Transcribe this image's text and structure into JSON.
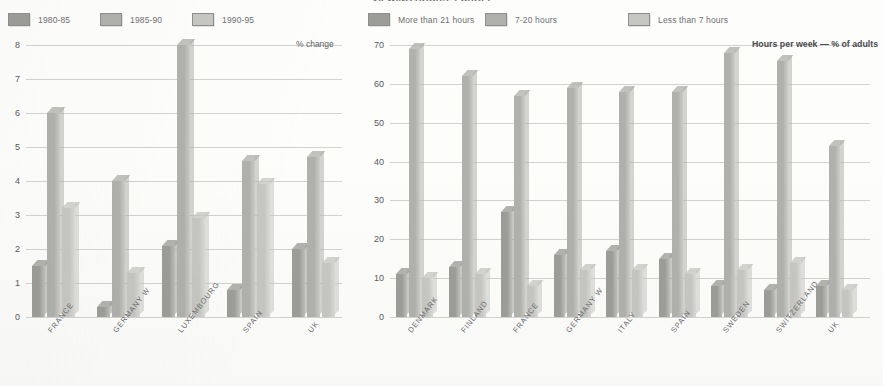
{
  "page": {
    "clipped_title": "VIEWING HOURS: EUROPE",
    "background_color": "#fdfdfc"
  },
  "palette": {
    "series_1": "#9c9c99",
    "series_2": "#b0b0ac",
    "series_3": "#c6c6c2",
    "gridline": "#d2d2cf",
    "text": "#6b6b6e"
  },
  "chart_data": [
    {
      "id": "left",
      "type": "bar",
      "title": "",
      "xlabel": "",
      "ylabel": "% change",
      "axis_caption": "% change",
      "ylim": [
        0,
        8
      ],
      "yticks": [
        0,
        1,
        2,
        3,
        4,
        5,
        6,
        7,
        8
      ],
      "grid": true,
      "legend_position": "top-left",
      "categories": [
        "FRANCE",
        "GERMANY W",
        "LUXEMBOURG",
        "SPAIN",
        "UK"
      ],
      "series": [
        {
          "name": "1980-85",
          "color": "#9c9c99",
          "values": [
            1.5,
            0.3,
            2.1,
            0.8,
            2.0
          ]
        },
        {
          "name": "1985-90",
          "color": "#b0b0ac",
          "values": [
            6.0,
            4.0,
            8.0,
            4.6,
            4.7
          ]
        },
        {
          "name": "1990-95",
          "color": "#c6c6c2",
          "values": [
            3.2,
            1.3,
            2.9,
            3.9,
            1.6
          ]
        }
      ]
    },
    {
      "id": "right",
      "type": "bar",
      "title": "",
      "xlabel": "",
      "ylabel": "Hours per week — % of adults",
      "axis_caption": "Hours per week — % of adults",
      "ylim": [
        0,
        70
      ],
      "yticks": [
        0,
        10,
        20,
        30,
        40,
        50,
        60,
        70
      ],
      "grid": true,
      "legend_position": "top-left",
      "categories": [
        "DENMARK",
        "FINLAND",
        "FRANCE",
        "GERMANY W",
        "ITALY",
        "SPAIN",
        "SWEDEN",
        "SWITZERLAND",
        "UK"
      ],
      "series": [
        {
          "name": "More than 21 hours",
          "color": "#9c9c99",
          "values": [
            11,
            13,
            27,
            16,
            17,
            15,
            8,
            7,
            8
          ]
        },
        {
          "name": "7-20 hours",
          "color": "#b0b0ac",
          "values": [
            69,
            62,
            57,
            59,
            58,
            58,
            68,
            66,
            44
          ]
        },
        {
          "name": "Less than 7 hours",
          "color": "#c6c6c2",
          "values": [
            10,
            11,
            8,
            12,
            12,
            11,
            12,
            14,
            7
          ]
        }
      ]
    }
  ]
}
